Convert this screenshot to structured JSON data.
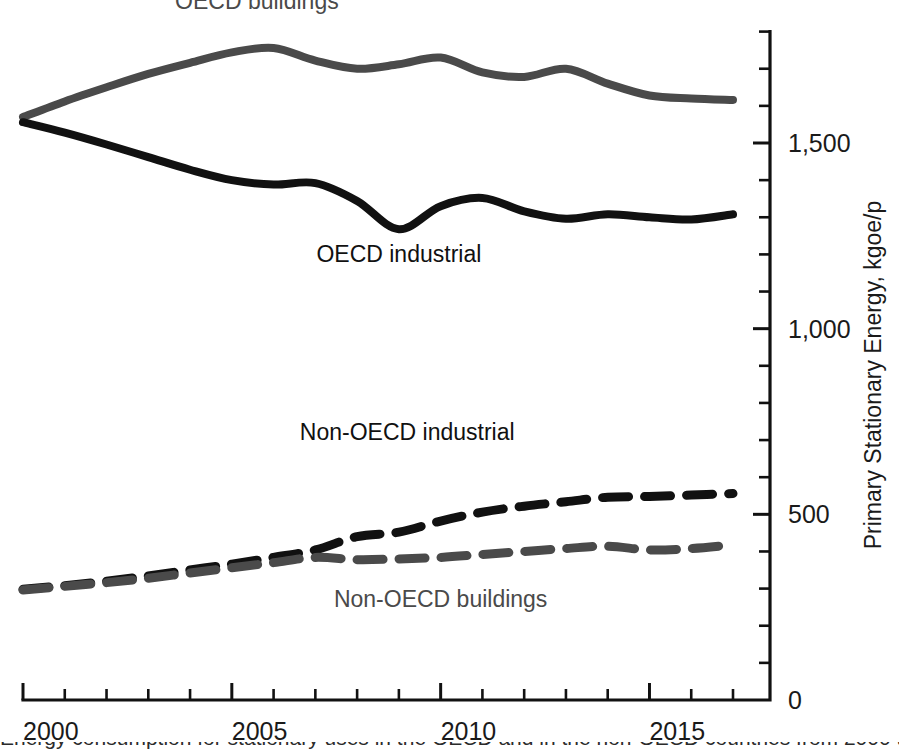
{
  "chart_data": {
    "type": "line",
    "title": "",
    "xlabel": "",
    "ylabel": "Primary Stationary Energy, kgoe/p",
    "xlim": [
      2000,
      2017.6
    ],
    "ylim": [
      0,
      1800
    ],
    "grid": false,
    "legend_position": "inline-labels",
    "x_ticks_major": [
      2000,
      2005,
      2010,
      2015
    ],
    "x_ticks_minor": [
      2001,
      2002,
      2003,
      2004,
      2006,
      2007,
      2008,
      2009,
      2011,
      2012,
      2013,
      2014,
      2016,
      2017
    ],
    "x_tick_labels": [
      "2000",
      "2005",
      "2010",
      "2015"
    ],
    "y_ticks_major": [
      0,
      500,
      1000,
      1500
    ],
    "y_ticks_minor": [
      100,
      200,
      300,
      400,
      600,
      700,
      800,
      900,
      1100,
      1200,
      1300,
      1400,
      1600,
      1700,
      1800
    ],
    "y_tick_labels": [
      "0",
      "500",
      "1,000",
      "1,500"
    ],
    "x": [
      2000,
      2001,
      2002,
      2003,
      2004,
      2005,
      2006,
      2007,
      2008,
      2009,
      2010,
      2011,
      2012,
      2013,
      2014,
      2015,
      2016,
      2017
    ],
    "series": [
      {
        "name": "OECD buildings",
        "color": "#4a4a4a",
        "style": "solid",
        "width": 8,
        "label_x": 2005.6,
        "label_y": 1860,
        "label_anchor": "middle",
        "values": [
          1570,
          1612,
          1650,
          1686,
          1716,
          1744,
          1756,
          1722,
          1700,
          1712,
          1730,
          1690,
          1678,
          1700,
          1660,
          1628,
          1620,
          1616
        ]
      },
      {
        "name": "OECD industrial",
        "color": "#111111",
        "style": "solid",
        "width": 8,
        "label_x": 2009.0,
        "label_y": 1180,
        "label_anchor": "middle",
        "values": [
          1556,
          1528,
          1496,
          1462,
          1428,
          1400,
          1388,
          1392,
          1344,
          1268,
          1330,
          1352,
          1316,
          1296,
          1308,
          1300,
          1294,
          1308
        ]
      },
      {
        "name": "Non-OECD industrial",
        "color": "#111111",
        "style": "dashed",
        "width": 9,
        "dash": "26 16",
        "label_x": 2009.2,
        "label_y": 700,
        "label_anchor": "middle",
        "values": [
          298,
          308,
          320,
          334,
          350,
          366,
          384,
          404,
          440,
          452,
          482,
          506,
          522,
          534,
          546,
          548,
          552,
          556
        ]
      },
      {
        "name": "Non-OECD buildings",
        "color": "#4a4a4a",
        "style": "dashed",
        "width": 9,
        "dash": "26 16",
        "label_x": 2010.0,
        "label_y": 250,
        "label_anchor": "middle",
        "values": [
          296,
          306,
          316,
          328,
          342,
          356,
          370,
          384,
          378,
          380,
          384,
          392,
          400,
          408,
          414,
          404,
          408,
          418
        ]
      }
    ]
  },
  "axes": {
    "y_axis_title": "Primary Stationary Energy, kgoe/p"
  },
  "caption": {
    "partial_line": "Energy consumption for stationary uses in the OECD and in the non-OECD countries from 2000 to 2017"
  }
}
